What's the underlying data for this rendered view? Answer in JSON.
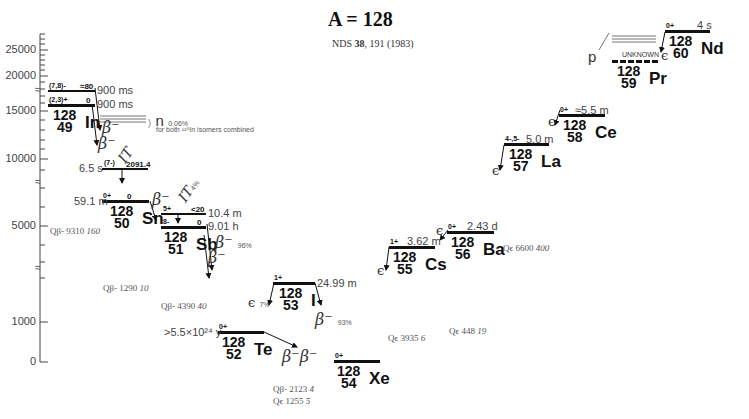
{
  "header": {
    "title": "A = 128",
    "reference_prefix": "NDS ",
    "reference_volume": "38",
    "reference_suffix": ", 191 (1983)"
  },
  "axis": {
    "ticks": [
      "25000",
      "20000",
      "15000",
      "10000",
      "5000",
      "1000",
      "0"
    ],
    "break_marks": [
      "≈",
      "≈",
      "≈"
    ]
  },
  "nuclides": {
    "In": {
      "mass": "128",
      "z": "49",
      "symbol": "In",
      "levels": [
        {
          "spin": "(7,8)-",
          "energy": "≈80",
          "halflife": "900 ms"
        },
        {
          "spin": "(2,3)+",
          "energy": "0",
          "halflife": "900 ms"
        }
      ],
      "decays": [
        "β⁻",
        "β⁻"
      ],
      "neutron_label": "n",
      "neutron_pct": "0.06%",
      "neutron_note": "for both ¹²⁸In isomers combined",
      "isomer": {
        "spin": "(7-)",
        "energy": "2091.4",
        "halflife": "6.5 s",
        "decay": "IT"
      },
      "q": {
        "label": "Qβ-",
        "value": "9310",
        "unc": "160"
      }
    },
    "Sn": {
      "mass": "128",
      "z": "50",
      "symbol": "Sn",
      "levels": [
        {
          "spin": "0+",
          "energy": "0",
          "halflife": "59.1 m"
        }
      ],
      "decays": [
        "β⁻"
      ],
      "q": {
        "label": "Qβ-",
        "value": "1290",
        "unc": "10"
      }
    },
    "Sb": {
      "mass": "128",
      "z": "51",
      "symbol": "Sb",
      "levels": [
        {
          "spin": "5+",
          "energy": "<20",
          "halflife": "10.4 m"
        },
        {
          "spin": "8-",
          "energy": "0",
          "halflife": "9.01 h"
        }
      ],
      "it_label": "IT",
      "it_pct": "4%",
      "decays": [
        "β⁻",
        "β⁻"
      ],
      "beta_pct": "96%",
      "q": {
        "label": "Qβ-",
        "value": "4390",
        "unc": "40"
      }
    },
    "I": {
      "mass": "128",
      "z": "53",
      "symbol": "I",
      "levels": [
        {
          "spin": "1+",
          "energy": "",
          "halflife": "24.99 m"
        }
      ],
      "ec_label": "ϵ",
      "ec_pct": "7%",
      "beta_label": "β⁻",
      "beta_pct": "93%",
      "q_beta": {
        "label": "Qβ-",
        "value": "2123",
        "unc": "4"
      },
      "q_ec": {
        "label": "Qϵ",
        "value": "1255",
        "unc": "5"
      }
    },
    "Te": {
      "mass": "128",
      "z": "52",
      "symbol": "Te",
      "levels": [
        {
          "spin": "0+",
          "energy": "",
          "halflife": ">5.5×10²⁴ y"
        }
      ],
      "decays": [
        "β⁻β⁻"
      ]
    },
    "Xe": {
      "mass": "128",
      "z": "54",
      "symbol": "Xe",
      "levels": [
        {
          "spin": "0+",
          "energy": "",
          "halflife": ""
        }
      ]
    },
    "Cs": {
      "mass": "128",
      "z": "55",
      "symbol": "Cs",
      "levels": [
        {
          "spin": "1+",
          "energy": "",
          "halflife": "3.62 m"
        }
      ],
      "decays": [
        "ϵ"
      ],
      "q": {
        "label": "Qϵ",
        "value": "3935",
        "unc": "6"
      }
    },
    "Ba": {
      "mass": "128",
      "z": "56",
      "symbol": "Ba",
      "levels": [
        {
          "spin": "0+",
          "energy": "",
          "halflife": "2.43 d"
        }
      ],
      "decays": [
        "ϵ"
      ],
      "q": {
        "label": "Qϵ",
        "value": "448",
        "unc": "19"
      }
    },
    "La": {
      "mass": "128",
      "z": "57",
      "symbol": "La",
      "levels": [
        {
          "spin": "4-,5-",
          "energy": "",
          "halflife": "5.0 m"
        }
      ],
      "decays": [
        "ϵ"
      ],
      "q": {
        "label": "Qϵ",
        "value": "6600",
        "unc": "400"
      }
    },
    "Ce": {
      "mass": "128",
      "z": "58",
      "symbol": "Ce",
      "levels": [
        {
          "spin": "0+",
          "energy": "",
          "halflife": "≈5.5 m"
        }
      ],
      "decays": [
        "ϵ"
      ]
    },
    "Pr": {
      "mass": "128",
      "z": "59",
      "symbol": "Pr",
      "levels": [
        {
          "spin": "",
          "energy": "",
          "halflife": "UNKNOWN"
        }
      ],
      "decays": [
        "p"
      ]
    },
    "Nd": {
      "mass": "128",
      "z": "60",
      "symbol": "Nd",
      "levels": [
        {
          "spin": "0+",
          "energy": "",
          "halflife": "4 s"
        }
      ],
      "decays": [
        "ϵ"
      ]
    }
  }
}
